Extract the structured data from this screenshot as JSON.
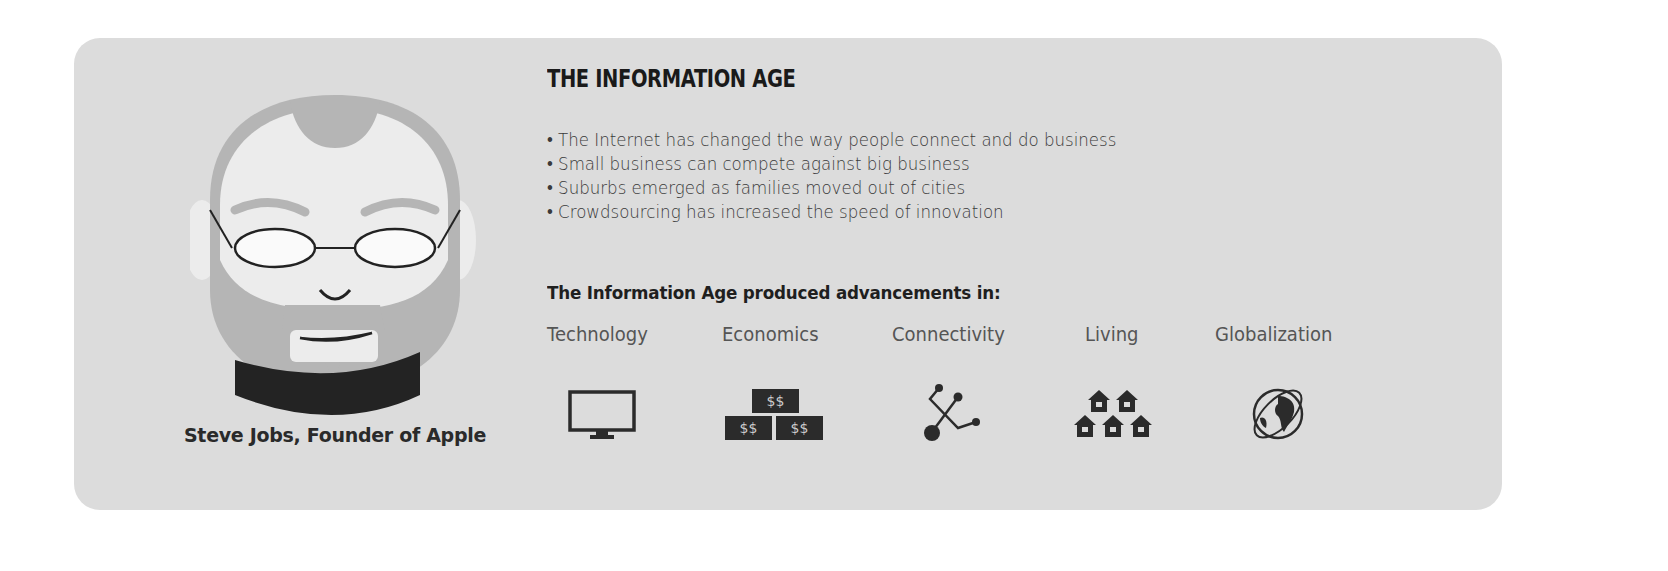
{
  "header": {
    "title": "THE INFORMATION AGE"
  },
  "bullets": [
    "• The Internet has changed the way people connect and do business",
    "• Small business can compete against big business",
    "• Suburbs emerged as families moved out of cities",
    "• Crowdsourcing has increased the speed of innovation"
  ],
  "advancements": {
    "heading": "The Information Age produced advancements in:",
    "categories": [
      {
        "label": "Technology",
        "icon": "monitor-icon"
      },
      {
        "label": "Economics",
        "icon": "money-stack-icon",
        "money_text": "$$"
      },
      {
        "label": "Connectivity",
        "icon": "network-nodes-icon"
      },
      {
        "label": "Living",
        "icon": "houses-icon"
      },
      {
        "label": "Globalization",
        "icon": "globe-icon"
      }
    ]
  },
  "portrait": {
    "caption": "Steve Jobs, Founder of Apple"
  },
  "colors": {
    "card": "#dcdcdc",
    "dark": "#2b2b2b",
    "hair": "#b3b3b3",
    "skin": "#ececec"
  }
}
